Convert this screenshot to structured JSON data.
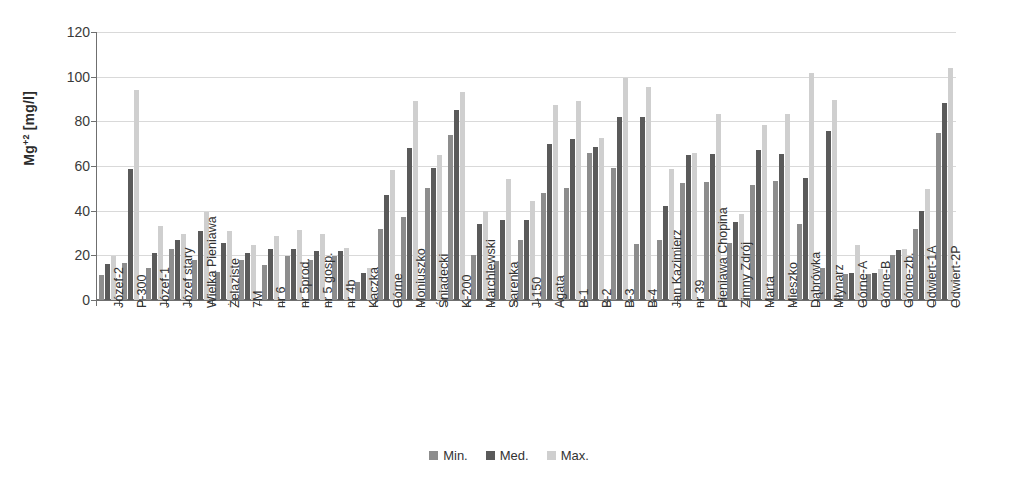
{
  "chart_data": {
    "type": "bar",
    "title": "",
    "subtitle": "",
    "xlabel": "",
    "ylabel": "Mg+2 [mg/l]",
    "ylabel_base": "Mg",
    "ylabel_sup": "+2",
    "ylabel_unit": " [mg/l]",
    "ylim": [
      0,
      120
    ],
    "ytick_values": [
      0,
      20,
      40,
      60,
      80,
      100,
      120
    ],
    "ytick_labels": [
      "0",
      "20",
      "40",
      "60",
      "80",
      "100",
      "120"
    ],
    "grid": true,
    "legend_position": "bottom",
    "legend": [
      "Min.",
      "Med.",
      "Max."
    ],
    "categories": [
      "Józef-2",
      "P-300",
      "Józef-1",
      "Józef stary",
      "Wielka Pieniawa",
      "Żelaziste",
      "7M",
      "nr 6",
      "nr 5prod.",
      "nr 5 gosp.",
      "nr 4b",
      "Kaczka",
      "Górne",
      "Moniuszko",
      "Śniadecki",
      "K-200",
      "Marchlewski",
      "Sarenka",
      "J-150",
      "Agata",
      "B-1",
      "B-2",
      "B-3",
      "B-4",
      "Jan Kazimierz",
      "nr 39",
      "Pieniawa Chopina",
      "Zimny Zdrój",
      "Marta",
      "Mieszko",
      "Dąbrówka",
      "Młynarz",
      "Górne-A",
      "Górne-B",
      "Górne-zb.",
      "Odwiert-1A",
      "Odwiert-2P"
    ],
    "series": [
      {
        "name": "Min.",
        "color": "#8d8d8d",
        "values": [
          11,
          16.5,
          14.5,
          23,
          18,
          12.5,
          18,
          15.5,
          19.5,
          18,
          19.5,
          8,
          32,
          37,
          50,
          74,
          20,
          17.5,
          27,
          48,
          50,
          66,
          59,
          25,
          27,
          52.5,
          53,
          25.5,
          51.5,
          53.5,
          34,
          14.5,
          11.5,
          11.5,
          20,
          32,
          75
        ]
      },
      {
        "name": "Med.",
        "color": "#5a5a5a",
        "values": [
          16,
          58.5,
          21,
          27,
          31,
          25.5,
          21,
          23,
          23,
          22,
          22,
          12,
          47,
          68,
          59,
          85,
          34,
          36,
          36,
          70,
          72,
          68.5,
          82,
          82,
          42,
          65,
          65.5,
          35,
          67,
          65.5,
          54.5,
          75.5,
          12,
          12,
          22.5,
          40,
          88
        ]
      },
      {
        "name": "Max.",
        "color": "#cfcfcf",
        "values": [
          19.5,
          94,
          33,
          29.5,
          39.5,
          31,
          24.5,
          28.5,
          31.5,
          29.5,
          23.5,
          14.5,
          58,
          89,
          65,
          93,
          40,
          54,
          44.5,
          87.5,
          89,
          72.5,
          99.5,
          95.5,
          58.5,
          66,
          83.5,
          38.5,
          78.5,
          83.5,
          101.5,
          89.5,
          24.5,
          14,
          23,
          49.5,
          104
        ]
      }
    ]
  }
}
